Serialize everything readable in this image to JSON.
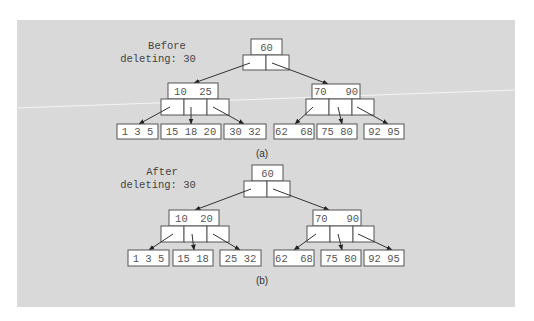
{
  "figure": {
    "background_color": "#d9d9d9",
    "box_stroke_color": "#555555",
    "text_color": "#555555"
  },
  "diagrams": [
    {
      "id": "a",
      "caption": "(a)",
      "label_line1": "Before",
      "label_line2": "deleting: 30",
      "root": {
        "keys": "60"
      },
      "internal": [
        {
          "keys": "10  25"
        },
        {
          "keys": "70   90"
        }
      ],
      "leaves": [
        {
          "keys": "1 3 5"
        },
        {
          "keys": "15 18 20"
        },
        {
          "keys": "30 32"
        },
        {
          "keys": "62  68"
        },
        {
          "keys": "75 80"
        },
        {
          "keys": "92 95"
        }
      ]
    },
    {
      "id": "b",
      "caption": "(b)",
      "label_line1": "After",
      "label_line2": "deleting: 30",
      "root": {
        "keys": "60"
      },
      "internal": [
        {
          "keys": "10  20"
        },
        {
          "keys": "70   90"
        }
      ],
      "leaves": [
        {
          "keys": "1 3 5"
        },
        {
          "keys": "15 18"
        },
        {
          "keys": "25 32"
        },
        {
          "keys": "62  68"
        },
        {
          "keys": "75 80"
        },
        {
          "keys": "92 95"
        }
      ]
    }
  ]
}
